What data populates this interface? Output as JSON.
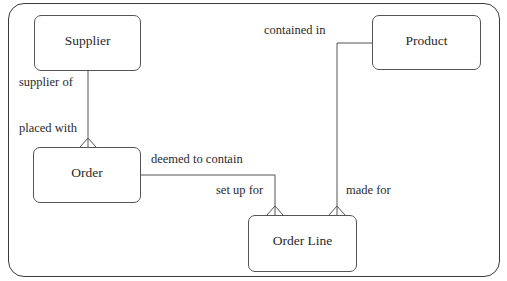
{
  "diagram": {
    "type": "entity-relationship",
    "entities": [
      {
        "id": "supplier",
        "label": "Supplier"
      },
      {
        "id": "order",
        "label": "Order"
      },
      {
        "id": "product",
        "label": "Product"
      },
      {
        "id": "order_line",
        "label": "Order Line"
      }
    ],
    "relationships": [
      {
        "from": "supplier",
        "to": "order",
        "from_label": "supplier of",
        "to_label": "placed with",
        "cardinality": "one-to-many"
      },
      {
        "from": "order",
        "to": "order_line",
        "from_label": "deemed to contain",
        "to_label": "set up for",
        "cardinality": "one-to-many"
      },
      {
        "from": "product",
        "to": "order_line",
        "from_label": "contained in",
        "to_label": "made for",
        "cardinality": "one-to-many"
      }
    ],
    "colors": {
      "line": "#555555",
      "frame": "#3a3a3a",
      "text": "#2a2a2a",
      "background": "#ffffff"
    }
  }
}
